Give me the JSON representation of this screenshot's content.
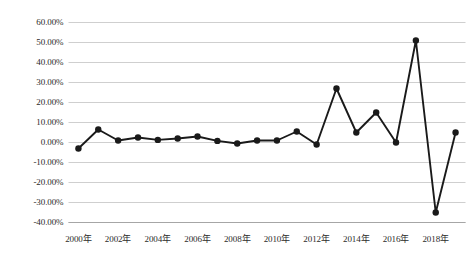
{
  "chart_data": {
    "type": "line",
    "title": "",
    "subtitle": "",
    "xlabel": "",
    "ylabel": "",
    "grid": true,
    "legend": false,
    "ylim": [
      -40,
      60
    ],
    "ytick_step": 10,
    "x": [
      "2000年",
      "2001年",
      "2002年",
      "2003年",
      "2004年",
      "2005年",
      "2006年",
      "2007年",
      "2008年",
      "2009年",
      "2010年",
      "2011年",
      "2012年",
      "2013年",
      "2014年",
      "2015年",
      "2016年",
      "2017年",
      "2018年",
      "2019年"
    ],
    "categories": [
      "2000年",
      "2001年",
      "2002年",
      "2003年",
      "2004年",
      "2005年",
      "2006年",
      "2007年",
      "2008年",
      "2009年",
      "2010年",
      "2011年",
      "2012年",
      "2013年",
      "2014年",
      "2015年",
      "2016年",
      "2017年",
      "2018年",
      "2019年"
    ],
    "values": [
      -3.0,
      6.5,
      1.0,
      2.5,
      1.3,
      2.0,
      3.0,
      0.8,
      -0.5,
      1.0,
      1.0,
      5.5,
      -1.0,
      27.0,
      5.0,
      15.0,
      0.0,
      51.0,
      -35.0,
      5.0
    ],
    "series": [
      {
        "name": "",
        "values": [
          -3.0,
          6.5,
          1.0,
          2.5,
          1.3,
          2.0,
          3.0,
          0.8,
          -0.5,
          1.0,
          1.0,
          5.5,
          -1.0,
          27.0,
          5.0,
          15.0,
          0.0,
          51.0,
          -35.0,
          5.0
        ]
      }
    ],
    "ytick_labels": [
      "60.00%",
      "50.00%",
      "40.00%",
      "30.00%",
      "20.00%",
      "10.00%",
      "0.00%",
      "-10.00%",
      "-20.00%",
      "-30.00%",
      "-40.00%"
    ],
    "ytick_values": [
      60,
      50,
      40,
      30,
      20,
      10,
      0,
      -10,
      -20,
      -30,
      -40
    ],
    "xtick_labels": [
      "2000年",
      "2002年",
      "2004年",
      "2006年",
      "2008年",
      "2010年",
      "2012年",
      "2014年",
      "2016年",
      "2018年"
    ],
    "xtick_indices": [
      0,
      2,
      4,
      6,
      8,
      10,
      12,
      14,
      16,
      18
    ],
    "colors": {
      "line": "#1a1a1a",
      "marker": "#1a1a1a",
      "grid": "#c9c9c9",
      "axis": "#a6a6a6",
      "text": "#2b2b2b",
      "background": "#ffffff"
    },
    "marker_size": 3.2,
    "line_width": 1.9
  }
}
